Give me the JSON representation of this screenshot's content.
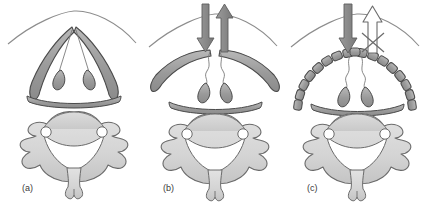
{
  "figure": {
    "width": 422,
    "height": 203,
    "background_color": "#ffffff"
  },
  "colors": {
    "cartilage_fill": "#9a9a9a",
    "cartilage_fill_light": "#b4b4b4",
    "cartilage_stroke": "#4a4a4a",
    "vertebra_fill": "#d8d8d8",
    "vertebra_body_fill": "#cfcfcf",
    "vertebra_stroke": "#6b6b6b",
    "skin_line": "#8d8d8d",
    "arrow_solid": "#8a8a8a",
    "arrow_solid_stroke": "#5d5d5d",
    "arrow_hollow_fill": "#ffffff",
    "arrow_hollow_stroke": "#6b6b6b",
    "cross_mark": "#6b6b6b",
    "thin_line": "#7a7a7a",
    "label_color": "#3a3a3a",
    "canal_fill": "#ffffff"
  },
  "panels": [
    {
      "id": "a",
      "label": "(a)",
      "label_x": 22,
      "label_y": 191,
      "airway_state": "patent",
      "arch_shape": "peaked-intact",
      "arch_segmented": false,
      "arrows": []
    },
    {
      "id": "b",
      "label": "(b)",
      "label_x": 163,
      "label_y": 191,
      "airway_state": "flattened",
      "arch_shape": "flattened-splayed",
      "arch_segmented": false,
      "arrows": [
        {
          "name": "inspiratory-down-arrow",
          "direction": "down",
          "style": "solid"
        },
        {
          "name": "expiratory-up-arrow",
          "direction": "up",
          "style": "solid"
        }
      ]
    },
    {
      "id": "c",
      "label": "(c)",
      "label_x": 307,
      "label_y": 191,
      "airway_state": "fragmented-obstructed",
      "arch_shape": "segmented-broken",
      "arch_segmented": true,
      "segment_count": 9,
      "arrows": [
        {
          "name": "inspiratory-down-arrow",
          "direction": "down",
          "style": "solid"
        },
        {
          "name": "blocked-up-arrow",
          "direction": "up",
          "style": "hollow",
          "crossed_out": true
        }
      ]
    }
  ],
  "anatomy": {
    "vertebra_name": "cervical-vertebra",
    "parts": [
      "vertebral-body",
      "transverse-foramen-left",
      "transverse-foramen-right",
      "vertebral-canal",
      "transverse-process-left",
      "transverse-process-right",
      "bifid-spinous-process"
    ],
    "airway_parts": [
      "tracheal-cartilage-left-limb",
      "tracheal-cartilage-right-limb",
      "suspension-line-left",
      "suspension-line-right",
      "nodule-left",
      "nodule-right",
      "posterior-membrane-bar"
    ],
    "skin_contour": "anterior-neck-contour"
  }
}
